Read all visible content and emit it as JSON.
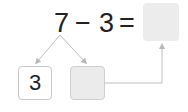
{
  "equation": {
    "minuend": "7",
    "operator": "−",
    "subtrahend": "3",
    "equals": "=",
    "result": ""
  },
  "decomposition": {
    "part_known": "3",
    "part_unknown": ""
  },
  "colors": {
    "line": "#c0c0c0",
    "blank_fill": "#ebebeb",
    "text": "#222222"
  }
}
